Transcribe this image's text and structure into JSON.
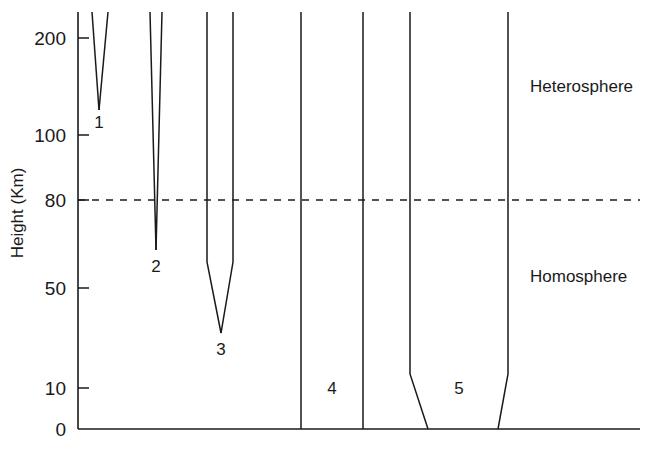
{
  "chart_data": {
    "type": "line",
    "title": "",
    "xlabel": "",
    "ylabel": "Height (Km)",
    "ylim": [
      0,
      230
    ],
    "grid": false,
    "legend_position": "none",
    "y_ticks": [
      {
        "label": "200",
        "value": 200,
        "py": 38
      },
      {
        "label": "100",
        "value": 100,
        "py": 135
      },
      {
        "label": "80",
        "value": 80,
        "py": 200
      },
      {
        "label": "50",
        "value": 50,
        "py": 288
      },
      {
        "label": "10",
        "value": 10,
        "py": 388
      },
      {
        "label": "0",
        "value": 0,
        "py": 429
      }
    ],
    "reference_lines": [
      {
        "name": "turbopause",
        "value": 80,
        "style": "dashed",
        "py": 200,
        "x_start": 78,
        "x_end": 640
      }
    ],
    "regions": [
      {
        "label": "Heterosphere",
        "x": 530,
        "y": 78
      },
      {
        "label": "Homosphere",
        "x": 530,
        "y": 268
      }
    ],
    "curves": [
      {
        "name": "1",
        "label": "1",
        "label_x": 99,
        "label_y": 114,
        "left_points": [
          [
            92,
            12
          ],
          [
            99,
            110
          ]
        ],
        "right_points": [
          [
            108,
            12
          ],
          [
            99,
            110
          ]
        ]
      },
      {
        "name": "2",
        "label": "2",
        "label_x": 156,
        "label_y": 258,
        "left_points": [
          [
            150,
            12
          ],
          [
            156,
            250
          ]
        ],
        "right_points": [
          [
            162,
            12
          ],
          [
            156,
            250
          ]
        ]
      },
      {
        "name": "3",
        "label": "3",
        "label_x": 221,
        "label_y": 341,
        "left_points": [
          [
            207,
            12
          ],
          [
            207,
            262
          ],
          [
            221,
            333
          ]
        ],
        "right_points": [
          [
            233,
            12
          ],
          [
            233,
            262
          ],
          [
            221,
            333
          ]
        ]
      },
      {
        "name": "4",
        "label": "4",
        "label_x": 332,
        "label_y": 380,
        "left_points": [
          [
            301,
            12
          ],
          [
            301,
            429
          ]
        ],
        "right_points": [
          [
            363,
            12
          ],
          [
            363,
            429
          ]
        ]
      },
      {
        "name": "5",
        "label": "5",
        "label_x": 459,
        "label_y": 380,
        "left_points": [
          [
            410,
            12
          ],
          [
            410,
            374
          ],
          [
            428,
            429
          ]
        ],
        "right_points": [
          [
            508,
            12
          ],
          [
            508,
            374
          ],
          [
            498,
            429
          ]
        ]
      }
    ],
    "axes": {
      "y_axis_x": 78,
      "x_axis_y": 429,
      "plot_top": 12,
      "plot_right": 640,
      "tick_length": 11,
      "line_color": "#1a1a1a"
    }
  }
}
